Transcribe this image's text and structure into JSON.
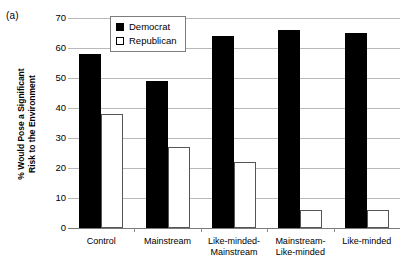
{
  "figure": {
    "panel_label": "(a)"
  },
  "chart_data": {
    "type": "bar",
    "title": "",
    "subtitle": "",
    "xlabel": "",
    "ylabel": "% Would Pose a Significant Risk to the Environment",
    "ylabel_line1": "% Would Pose a Significant",
    "ylabel_line2": "Risk to the Environment",
    "ylim": [
      0,
      70
    ],
    "yticks": [
      0,
      10,
      20,
      30,
      40,
      50,
      60,
      70
    ],
    "ytick_labels": [
      "0",
      "10",
      "20",
      "30",
      "40",
      "50",
      "60",
      "70"
    ],
    "grid": true,
    "legend_position": "top-center-inside",
    "categories": [
      "Control",
      "Mainstream",
      "Like-minded-Mainstream",
      "Mainstream-Like-minded",
      "Like-minded"
    ],
    "category_lines": [
      [
        "Control"
      ],
      [
        "Mainstream"
      ],
      [
        "Like-minded-",
        "Mainstream"
      ],
      [
        "Mainstream-",
        "Like-minded"
      ],
      [
        "Like-minded"
      ]
    ],
    "series": [
      {
        "name": "Democrat",
        "color": "#000000",
        "fill": "solid",
        "values": [
          58,
          49,
          64,
          66,
          65
        ]
      },
      {
        "name": "Republican",
        "color": "#ffffff",
        "fill": "open",
        "values": [
          38,
          27,
          22,
          6,
          6
        ]
      }
    ]
  }
}
